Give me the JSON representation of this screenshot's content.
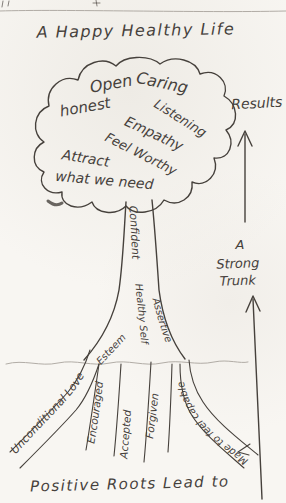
{
  "title": "A Happy Healthy Life",
  "caption": "Positive Roots Lead to",
  "results": {
    "label": "Results"
  },
  "strong_trunk": {
    "line1": "A",
    "line2": "Strong",
    "line3": "Trunk"
  },
  "cloud": {
    "open": "Open",
    "caring": "Caring",
    "honest": "honest",
    "listening": "Listening",
    "empathy": "Empathy",
    "feel_worthy": "Feel Worthy",
    "attract": "Attract",
    "what_we_need": "what we need"
  },
  "trunk": {
    "confident": "Confident",
    "healthy_self": "Healthy Self",
    "esteem": "Esteem",
    "assertive": "Assertive"
  },
  "roots": {
    "unconditional_love": "Unconditional Love",
    "encouraged": "Encouraged",
    "accepted": "Accepted",
    "forgiven": "Forgiven",
    "made_to_feel_capable": "Made to feel capable"
  },
  "colors": {
    "ink": "#46413c",
    "pencil": "#9b958e",
    "paper": "#f8f6f2"
  }
}
